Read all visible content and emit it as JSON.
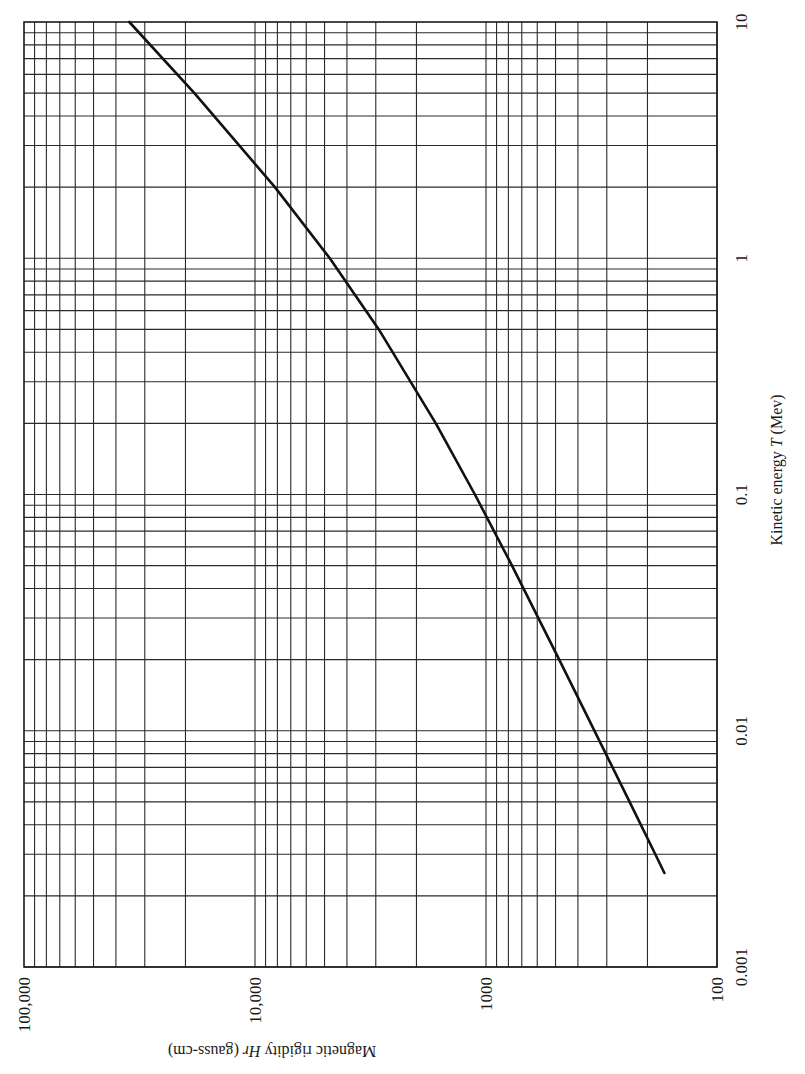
{
  "chart_data": {
    "type": "line",
    "orientation": "rotated-90",
    "title": "",
    "xlabel": "Kinetic energy T (Mev)",
    "ylabel": "Magnetic rigidity Hr (gauss-cm)",
    "xscale": "log",
    "yscale": "log",
    "xlim": [
      0.001,
      10
    ],
    "ylim": [
      100,
      100000
    ],
    "x_ticks": [
      "0.001",
      "0.01",
      "0.1",
      "1",
      "10"
    ],
    "y_ticks": [
      "100",
      "1000",
      "10,000",
      "100,000"
    ],
    "grid": true,
    "legend": null,
    "series": [
      {
        "name": "Electron magnetic rigidity",
        "x": [
          0.0025,
          0.003,
          0.005,
          0.01,
          0.02,
          0.05,
          0.1,
          0.2,
          0.5,
          1,
          2,
          5,
          10
        ],
        "y": [
          169,
          185,
          239,
          339,
          482,
          772,
          1117,
          1649,
          2910,
          4743,
          8201,
          18303,
          35020
        ]
      }
    ]
  },
  "labels": {
    "x_title": "Kinetic energy",
    "x_title_var": "T",
    "x_title_unit": "(Mev)",
    "y_title": "Magnetic rigidity",
    "y_title_var": "Hr",
    "y_title_unit": "(gauss-cm)"
  }
}
